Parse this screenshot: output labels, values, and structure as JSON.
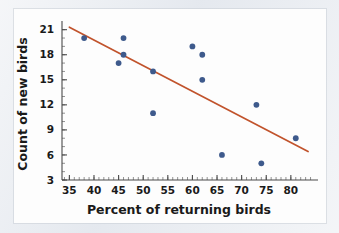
{
  "chart_data": {
    "type": "scatter",
    "title": "",
    "xlabel": "Percent of returning birds",
    "ylabel": "Count of new birds",
    "xlim": [
      33.5,
      84.5
    ],
    "ylim": [
      3,
      21.8
    ],
    "xticks": [
      35,
      40,
      45,
      50,
      55,
      60,
      65,
      70,
      75,
      80
    ],
    "yticks": [
      3,
      6,
      9,
      12,
      15,
      18,
      21
    ],
    "xtick_labels": [
      "35",
      "40",
      "45",
      "50",
      "55",
      "60",
      "65",
      "70",
      "75",
      "80"
    ],
    "ytick_labels": [
      "3",
      "6",
      "9",
      "12",
      "15",
      "18",
      "21"
    ],
    "grid": false,
    "legend": "none",
    "points": [
      {
        "x": 38,
        "y": 20
      },
      {
        "x": 45,
        "y": 17
      },
      {
        "x": 46,
        "y": 18
      },
      {
        "x": 46,
        "y": 20
      },
      {
        "x": 52,
        "y": 16
      },
      {
        "x": 52,
        "y": 11
      },
      {
        "x": 60,
        "y": 19
      },
      {
        "x": 62,
        "y": 18
      },
      {
        "x": 62,
        "y": 15
      },
      {
        "x": 66,
        "y": 6
      },
      {
        "x": 73,
        "y": 12
      },
      {
        "x": 74,
        "y": 5
      },
      {
        "x": 81,
        "y": 8
      }
    ],
    "trend_line": {
      "x_start": 35,
      "y_start": 21.3,
      "x_end": 83.5,
      "y_end": 6.4
    },
    "colors": {
      "point": "#3e5a8c",
      "trend_line": "#c1532c",
      "axis": "#4a4a4a",
      "text": "#1a1a1a",
      "plot_background": "#fdfdfd",
      "figure_background": "#e8ebf0"
    }
  }
}
